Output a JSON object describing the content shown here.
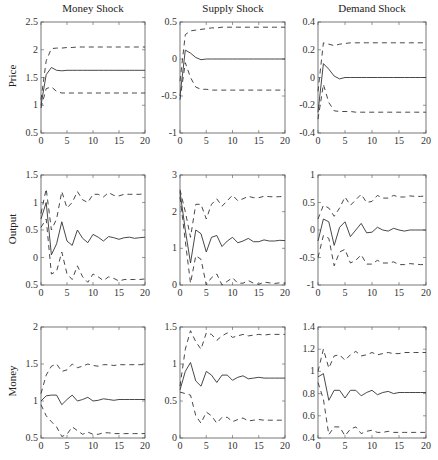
{
  "figure": {
    "column_titles": [
      "Money Shock",
      "Supply Shock",
      "Demand Shock"
    ],
    "row_labels": [
      "Price",
      "Output",
      "Money"
    ]
  },
  "chart_data": [
    {
      "type": "line",
      "row": 0,
      "col": 0,
      "title": "Money Shock",
      "ylabel": "Price",
      "xlabel": "",
      "xlim": [
        0,
        20
      ],
      "ylim": [
        0.5,
        2.5
      ],
      "xticks": [
        0,
        5,
        10,
        15,
        20
      ],
      "yticks": [
        0.5,
        1,
        1.5,
        2,
        2.5
      ],
      "x": [
        0,
        1,
        2,
        3,
        4,
        5,
        6,
        7,
        8,
        9,
        10,
        11,
        12,
        13,
        14,
        15,
        16,
        17,
        18,
        19,
        20
      ],
      "series": [
        {
          "name": "response",
          "style": "solid",
          "values": [
            1.0,
            1.55,
            1.68,
            1.63,
            1.62,
            1.63,
            1.63,
            1.63,
            1.63,
            1.63,
            1.63,
            1.63,
            1.63,
            1.63,
            1.63,
            1.63,
            1.63,
            1.63,
            1.63,
            1.63,
            1.63
          ]
        },
        {
          "name": "upper band",
          "style": "dashed",
          "values": [
            1.1,
            1.8,
            2.02,
            2.03,
            2.03,
            2.04,
            2.04,
            2.05,
            2.05,
            2.05,
            2.05,
            2.05,
            2.05,
            2.05,
            2.05,
            2.05,
            2.05,
            2.05,
            2.05,
            2.05,
            2.05
          ]
        },
        {
          "name": "lower band",
          "style": "dashed",
          "values": [
            0.95,
            1.3,
            1.33,
            1.25,
            1.22,
            1.22,
            1.22,
            1.22,
            1.22,
            1.22,
            1.22,
            1.22,
            1.22,
            1.22,
            1.22,
            1.22,
            1.22,
            1.22,
            1.22,
            1.22,
            1.22
          ]
        }
      ]
    },
    {
      "type": "line",
      "row": 0,
      "col": 1,
      "title": "Supply Shock",
      "ylabel": "",
      "xlabel": "",
      "xlim": [
        0,
        20
      ],
      "ylim": [
        -1,
        0.5
      ],
      "xticks": [
        0,
        5,
        10,
        15,
        20
      ],
      "yticks": [
        -1,
        -0.5,
        0,
        0.5
      ],
      "x": [
        0,
        1,
        2,
        3,
        4,
        5,
        6,
        7,
        8,
        9,
        10,
        11,
        12,
        13,
        14,
        15,
        16,
        17,
        18,
        19,
        20
      ],
      "series": [
        {
          "name": "response",
          "style": "solid",
          "values": [
            -0.5,
            0.12,
            0.08,
            0.02,
            -0.01,
            0,
            0,
            0,
            0,
            0,
            0,
            0,
            0,
            0,
            0,
            0,
            0,
            0,
            0,
            0,
            0
          ]
        },
        {
          "name": "upper band",
          "style": "dashed",
          "values": [
            -0.3,
            0.33,
            0.38,
            0.39,
            0.4,
            0.41,
            0.42,
            0.42,
            0.43,
            0.43,
            0.43,
            0.43,
            0.43,
            0.43,
            0.43,
            0.43,
            0.43,
            0.43,
            0.43,
            0.43,
            0.43
          ]
        },
        {
          "name": "lower band",
          "style": "dashed",
          "values": [
            -0.55,
            -0.05,
            -0.25,
            -0.38,
            -0.41,
            -0.41,
            -0.42,
            -0.42,
            -0.42,
            -0.42,
            -0.42,
            -0.42,
            -0.42,
            -0.42,
            -0.42,
            -0.42,
            -0.42,
            -0.42,
            -0.42,
            -0.42,
            -0.42
          ]
        }
      ]
    },
    {
      "type": "line",
      "row": 0,
      "col": 2,
      "title": "Demand Shock",
      "ylabel": "",
      "xlabel": "",
      "xlim": [
        0,
        20
      ],
      "ylim": [
        -0.4,
        0.4
      ],
      "xticks": [
        0,
        5,
        10,
        15,
        20
      ],
      "yticks": [
        -0.4,
        -0.2,
        0,
        0.2,
        0.4
      ],
      "x": [
        0,
        1,
        2,
        3,
        4,
        5,
        6,
        7,
        8,
        9,
        10,
        11,
        12,
        13,
        14,
        15,
        16,
        17,
        18,
        19,
        20
      ],
      "series": [
        {
          "name": "response",
          "style": "solid",
          "values": [
            -0.25,
            0.1,
            0.06,
            0.01,
            -0.01,
            0,
            0,
            0,
            0,
            0,
            0,
            0,
            0,
            0,
            0,
            0,
            0,
            0,
            0,
            0,
            0
          ]
        },
        {
          "name": "upper band",
          "style": "dashed",
          "values": [
            -0.1,
            0.25,
            0.24,
            0.23,
            0.24,
            0.245,
            0.25,
            0.25,
            0.25,
            0.25,
            0.25,
            0.25,
            0.25,
            0.25,
            0.25,
            0.25,
            0.25,
            0.25,
            0.25,
            0.25,
            0.25
          ]
        },
        {
          "name": "lower band",
          "style": "dashed",
          "values": [
            -0.3,
            -0.05,
            -0.18,
            -0.24,
            -0.245,
            -0.245,
            -0.245,
            -0.25,
            -0.25,
            -0.25,
            -0.25,
            -0.25,
            -0.25,
            -0.25,
            -0.25,
            -0.25,
            -0.25,
            -0.25,
            -0.25,
            -0.25,
            -0.25
          ]
        }
      ]
    },
    {
      "type": "line",
      "row": 1,
      "col": 0,
      "title": "",
      "ylabel": "Output",
      "xlabel": "",
      "xlim": [
        0,
        20
      ],
      "ylim": [
        -0.5,
        1.5
      ],
      "xticks": [
        0,
        5,
        10,
        15,
        20
      ],
      "yticks": [
        -0.5,
        0,
        0.5,
        1,
        1.5
      ],
      "yticklabels": [
        "0.5",
        "0",
        "0.5",
        "1",
        "1.5"
      ],
      "x": [
        0,
        1,
        2,
        3,
        4,
        5,
        6,
        7,
        8,
        9,
        10,
        11,
        12,
        13,
        14,
        15,
        16,
        17,
        18,
        19,
        20
      ],
      "series": [
        {
          "name": "response",
          "style": "solid",
          "values": [
            0.7,
            1.0,
            0.05,
            0.25,
            0.65,
            0.3,
            0.22,
            0.5,
            0.35,
            0.27,
            0.42,
            0.37,
            0.3,
            0.38,
            0.36,
            0.33,
            0.36,
            0.37,
            0.35,
            0.36,
            0.37
          ]
        },
        {
          "name": "upper band",
          "style": "dashed",
          "values": [
            0.8,
            1.25,
            0.5,
            0.7,
            1.2,
            0.9,
            1.0,
            1.2,
            1.05,
            1.0,
            1.15,
            1.15,
            1.1,
            1.18,
            1.13,
            1.12,
            1.15,
            1.15,
            1.15,
            1.15,
            1.16
          ]
        },
        {
          "name": "lower band",
          "style": "dashed",
          "values": [
            0.55,
            0.7,
            -0.3,
            -0.25,
            0.1,
            -0.3,
            -0.4,
            -0.15,
            -0.35,
            -0.45,
            -0.3,
            -0.35,
            -0.42,
            -0.35,
            -0.38,
            -0.43,
            -0.4,
            -0.4,
            -0.4,
            -0.4,
            -0.39
          ]
        }
      ]
    },
    {
      "type": "line",
      "row": 1,
      "col": 1,
      "title": "",
      "ylabel": "",
      "xlabel": "",
      "xlim": [
        0,
        20
      ],
      "ylim": [
        0,
        3
      ],
      "xticks": [
        0,
        5,
        10,
        15,
        20
      ],
      "yticks": [
        0,
        1,
        2,
        3
      ],
      "x": [
        0,
        1,
        2,
        3,
        4,
        5,
        6,
        7,
        8,
        9,
        10,
        11,
        12,
        13,
        14,
        15,
        16,
        17,
        18,
        19,
        20
      ],
      "series": [
        {
          "name": "response",
          "style": "solid",
          "values": [
            2.55,
            1.5,
            0.6,
            1.5,
            1.4,
            0.9,
            1.3,
            1.35,
            1.05,
            1.2,
            1.3,
            1.15,
            1.2,
            1.27,
            1.18,
            1.18,
            1.23,
            1.2,
            1.2,
            1.22,
            1.21
          ]
        },
        {
          "name": "upper band",
          "style": "dashed",
          "values": [
            2.6,
            2.0,
            1.3,
            2.2,
            2.2,
            1.8,
            2.2,
            2.35,
            2.15,
            2.3,
            2.45,
            2.3,
            2.35,
            2.42,
            2.38,
            2.38,
            2.42,
            2.41,
            2.4,
            2.41,
            2.41
          ]
        },
        {
          "name": "lower band",
          "style": "dashed",
          "values": [
            2.4,
            1.2,
            0.05,
            0.8,
            0.7,
            0.0,
            0.2,
            0.3,
            0.0,
            0.1,
            0.2,
            0.05,
            0.05,
            0.12,
            0.05,
            0.02,
            0.08,
            0.06,
            0.04,
            0.06,
            0.05
          ]
        }
      ]
    },
    {
      "type": "line",
      "row": 1,
      "col": 2,
      "title": "",
      "ylabel": "",
      "xlabel": "",
      "xlim": [
        0,
        20
      ],
      "ylim": [
        -1,
        1
      ],
      "xticks": [
        0,
        5,
        10,
        15,
        20
      ],
      "yticks": [
        -1,
        -0.5,
        0,
        0.5,
        1
      ],
      "x": [
        0,
        1,
        2,
        3,
        4,
        5,
        6,
        7,
        8,
        9,
        10,
        11,
        12,
        13,
        14,
        15,
        16,
        17,
        18,
        19,
        20
      ],
      "series": [
        {
          "name": "response",
          "style": "solid",
          "values": [
            -0.2,
            0.2,
            0.15,
            -0.28,
            0.05,
            0.15,
            -0.12,
            0.0,
            0.12,
            -0.05,
            -0.04,
            0.05,
            0.0,
            -0.02,
            0.03,
            0.0,
            -0.02,
            0.0,
            0.0,
            0.0,
            0.0
          ]
        },
        {
          "name": "upper band",
          "style": "dashed",
          "values": [
            0.2,
            0.45,
            0.4,
            0.25,
            0.4,
            0.6,
            0.45,
            0.55,
            0.65,
            0.5,
            0.52,
            0.63,
            0.58,
            0.58,
            0.63,
            0.6,
            0.6,
            0.62,
            0.61,
            0.61,
            0.62
          ]
        },
        {
          "name": "lower band",
          "style": "dashed",
          "values": [
            -0.5,
            -0.1,
            -0.15,
            -0.65,
            -0.4,
            -0.35,
            -0.6,
            -0.55,
            -0.45,
            -0.62,
            -0.62,
            -0.55,
            -0.6,
            -0.6,
            -0.58,
            -0.63,
            -0.63,
            -0.61,
            -0.62,
            -0.63,
            -0.63
          ]
        }
      ]
    },
    {
      "type": "line",
      "row": 2,
      "col": 0,
      "title": "",
      "ylabel": "Money",
      "xlabel": "",
      "xlim": [
        0,
        20
      ],
      "ylim": [
        0.5,
        2
      ],
      "xticks": [
        0,
        5,
        10,
        15,
        20
      ],
      "yticks": [
        0.5,
        1,
        1.5,
        2
      ],
      "x": [
        0,
        1,
        2,
        3,
        4,
        5,
        6,
        7,
        8,
        9,
        10,
        11,
        12,
        13,
        14,
        15,
        16,
        17,
        18,
        19,
        20
      ],
      "series": [
        {
          "name": "response",
          "style": "solid",
          "values": [
            1.0,
            1.07,
            1.08,
            1.08,
            0.95,
            1.02,
            1.08,
            1.0,
            1.02,
            1.05,
            1.0,
            1.01,
            1.03,
            1.02,
            1.01,
            1.02,
            1.02,
            1.02,
            1.02,
            1.02,
            1.02
          ]
        },
        {
          "name": "upper band",
          "style": "dashed",
          "values": [
            1.1,
            1.35,
            1.47,
            1.5,
            1.4,
            1.42,
            1.5,
            1.45,
            1.47,
            1.5,
            1.48,
            1.47,
            1.49,
            1.49,
            1.48,
            1.49,
            1.49,
            1.49,
            1.49,
            1.49,
            1.49
          ]
        },
        {
          "name": "lower band",
          "style": "dashed",
          "values": [
            0.95,
            0.8,
            0.72,
            0.65,
            0.52,
            0.55,
            0.65,
            0.6,
            0.55,
            0.58,
            0.55,
            0.55,
            0.57,
            0.57,
            0.56,
            0.56,
            0.56,
            0.56,
            0.56,
            0.56,
            0.56
          ]
        }
      ]
    },
    {
      "type": "line",
      "row": 2,
      "col": 1,
      "title": "",
      "ylabel": "",
      "xlabel": "",
      "xlim": [
        0,
        20
      ],
      "ylim": [
        0,
        1.5
      ],
      "xticks": [
        0,
        5,
        10,
        15,
        20
      ],
      "yticks": [
        0,
        0.5,
        1,
        1.5
      ],
      "x": [
        0,
        1,
        2,
        3,
        4,
        5,
        6,
        7,
        8,
        9,
        10,
        11,
        12,
        13,
        14,
        15,
        16,
        17,
        18,
        19,
        20
      ],
      "series": [
        {
          "name": "response",
          "style": "solid",
          "values": [
            0.65,
            0.9,
            1.02,
            0.77,
            0.7,
            0.9,
            0.85,
            0.75,
            0.85,
            0.85,
            0.78,
            0.82,
            0.84,
            0.8,
            0.81,
            0.82,
            0.81,
            0.81,
            0.81,
            0.81,
            0.81
          ]
        },
        {
          "name": "upper band",
          "style": "dashed",
          "values": [
            0.7,
            1.2,
            1.45,
            1.3,
            1.2,
            1.42,
            1.4,
            1.32,
            1.38,
            1.42,
            1.36,
            1.38,
            1.4,
            1.38,
            1.39,
            1.4,
            1.39,
            1.4,
            1.4,
            1.4,
            1.4
          ]
        },
        {
          "name": "lower band",
          "style": "dashed",
          "values": [
            0.62,
            0.6,
            0.58,
            0.3,
            0.2,
            0.35,
            0.3,
            0.2,
            0.28,
            0.28,
            0.22,
            0.25,
            0.27,
            0.23,
            0.24,
            0.25,
            0.24,
            0.24,
            0.24,
            0.24,
            0.24
          ]
        }
      ]
    },
    {
      "type": "line",
      "row": 2,
      "col": 2,
      "title": "",
      "ylabel": "",
      "xlabel": "",
      "xlim": [
        0,
        20
      ],
      "ylim": [
        0.4,
        1.4
      ],
      "xticks": [
        0,
        5,
        10,
        15,
        20
      ],
      "yticks": [
        0.4,
        0.6,
        0.8,
        1,
        1.2,
        1.4
      ],
      "x": [
        0,
        1,
        2,
        3,
        4,
        5,
        6,
        7,
        8,
        9,
        10,
        11,
        12,
        13,
        14,
        15,
        16,
        17,
        18,
        19,
        20
      ],
      "series": [
        {
          "name": "response",
          "style": "solid",
          "values": [
            0.95,
            0.98,
            0.74,
            0.83,
            0.83,
            0.76,
            0.83,
            0.83,
            0.78,
            0.81,
            0.83,
            0.79,
            0.81,
            0.82,
            0.8,
            0.81,
            0.81,
            0.81,
            0.81,
            0.81,
            0.81
          ]
        },
        {
          "name": "upper band",
          "style": "dashed",
          "values": [
            1.0,
            1.2,
            1.03,
            1.14,
            1.15,
            1.1,
            1.15,
            1.18,
            1.14,
            1.15,
            1.17,
            1.15,
            1.16,
            1.17,
            1.16,
            1.16,
            1.17,
            1.17,
            1.17,
            1.17,
            1.17
          ]
        },
        {
          "name": "lower band",
          "style": "dashed",
          "values": [
            0.9,
            0.75,
            0.43,
            0.5,
            0.5,
            0.42,
            0.48,
            0.5,
            0.44,
            0.46,
            0.47,
            0.45,
            0.45,
            0.46,
            0.45,
            0.45,
            0.45,
            0.45,
            0.45,
            0.45,
            0.45
          ]
        }
      ]
    }
  ],
  "layout": {
    "line_color": "#333333",
    "axis_color": "#555555"
  }
}
